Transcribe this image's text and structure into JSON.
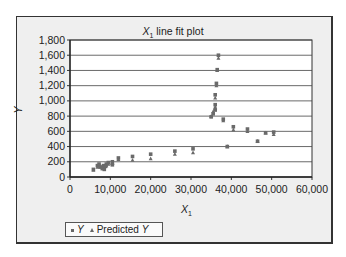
{
  "chart_data": {
    "type": "scatter",
    "title": "X1 line fit plot",
    "title_main": "X",
    "title_sub": "1",
    "title_rest": " line fit plot",
    "xlabel": "X1",
    "xlabel_main": "X",
    "xlabel_sub": "1",
    "ylabel": "Y",
    "xlim": [
      0,
      60000
    ],
    "ylim": [
      0,
      1800
    ],
    "xticks": [
      "0",
      "10,000",
      "20,000",
      "30,000",
      "40,000",
      "50,000",
      "60,000"
    ],
    "yticks": [
      "0",
      "200",
      "400",
      "600",
      "800",
      "1,000",
      "1,200",
      "1,400",
      "1,600",
      "1,800"
    ],
    "grid": "horizontal",
    "legend_position": "bottom-left",
    "legend": [
      "Y",
      "Predicted Y"
    ],
    "series": [
      {
        "name": "Y",
        "marker": "square",
        "points": [
          [
            5800,
            100
          ],
          [
            6800,
            150
          ],
          [
            7200,
            170
          ],
          [
            7500,
            130
          ],
          [
            8000,
            110
          ],
          [
            8300,
            150
          ],
          [
            8500,
            100
          ],
          [
            8800,
            140
          ],
          [
            9000,
            170
          ],
          [
            9500,
            190
          ],
          [
            10500,
            200
          ],
          [
            10500,
            160
          ],
          [
            12000,
            250
          ],
          [
            15500,
            270
          ],
          [
            20000,
            300
          ],
          [
            26000,
            340
          ],
          [
            30500,
            370
          ],
          [
            35000,
            790
          ],
          [
            35500,
            830
          ],
          [
            36000,
            880
          ],
          [
            36000,
            950
          ],
          [
            36000,
            1080
          ],
          [
            36300,
            1230
          ],
          [
            36500,
            1410
          ],
          [
            36800,
            1600
          ],
          [
            38000,
            760
          ],
          [
            39000,
            400
          ],
          [
            40500,
            660
          ],
          [
            44000,
            630
          ],
          [
            46500,
            470
          ],
          [
            48500,
            580
          ],
          [
            50500,
            590
          ]
        ]
      },
      {
        "name": "Predicted Y",
        "marker": "triangle",
        "points": [
          [
            5800,
            90
          ],
          [
            6800,
            130
          ],
          [
            7200,
            150
          ],
          [
            7500,
            150
          ],
          [
            8000,
            140
          ],
          [
            8300,
            140
          ],
          [
            8500,
            130
          ],
          [
            8800,
            150
          ],
          [
            9000,
            150
          ],
          [
            9500,
            170
          ],
          [
            10500,
            180
          ],
          [
            10500,
            180
          ],
          [
            12000,
            230
          ],
          [
            15500,
            220
          ],
          [
            20000,
            240
          ],
          [
            26000,
            300
          ],
          [
            30500,
            320
          ],
          [
            35000,
            800
          ],
          [
            35500,
            860
          ],
          [
            36000,
            900
          ],
          [
            36000,
            920
          ],
          [
            36000,
            1040
          ],
          [
            36300,
            1200
          ],
          [
            36500,
            1400
          ],
          [
            36800,
            1560
          ],
          [
            38000,
            740
          ],
          [
            39000,
            400
          ],
          [
            40500,
            620
          ],
          [
            44000,
            600
          ],
          [
            46500,
            470
          ],
          [
            48500,
            580
          ],
          [
            50500,
            560
          ]
        ]
      }
    ]
  },
  "legend": {
    "y_label": "Y",
    "predicted_prefix": "Predicted ",
    "predicted_var": "Y"
  }
}
